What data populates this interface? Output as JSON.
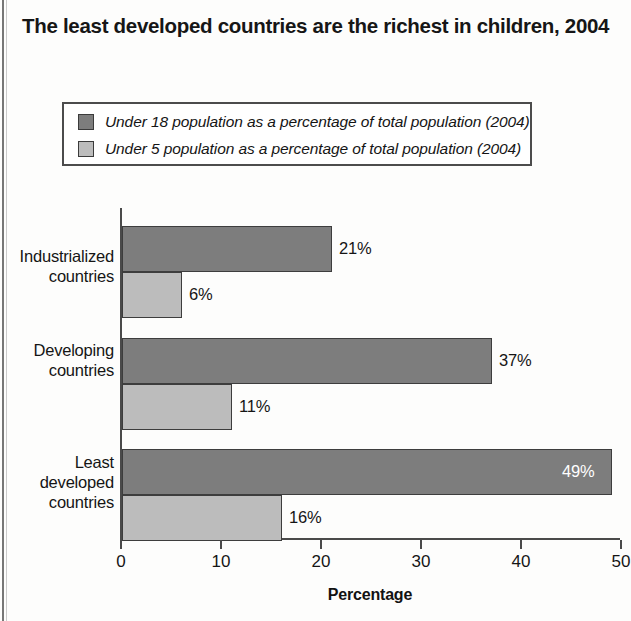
{
  "title": "The least developed countries are the richest in children, 2004",
  "legend": {
    "items": [
      {
        "label": "Under 18 population as a percentage of total population (2004)",
        "color": "#7d7d7d",
        "name": "under-18"
      },
      {
        "label": "Under 5 population as a percentage of total population (2004)",
        "color": "#bcbcbc",
        "name": "under-5"
      }
    ]
  },
  "chart_data": {
    "type": "bar",
    "orientation": "horizontal",
    "title": "The least developed countries are the richest in children, 2004",
    "xlabel": "Percentage",
    "ylabel": "",
    "xlim": [
      0,
      50
    ],
    "xticks": [
      0,
      10,
      20,
      30,
      40,
      50
    ],
    "xtick_labels": [
      "0",
      "10",
      "20",
      "30",
      "40",
      "50"
    ],
    "grid": false,
    "legend_position": "top",
    "categories": [
      "Industrialized countries",
      "Developing countries",
      "Least developed countries"
    ],
    "series": [
      {
        "name": "Under 18 population as a percentage of total population (2004)",
        "color": "#7d7d7d",
        "values": [
          21,
          37,
          49
        ],
        "labels": [
          "21%",
          "37%",
          "49%"
        ]
      },
      {
        "name": "Under 5 population as a percentage of total population (2004)",
        "color": "#bcbcbc",
        "values": [
          6,
          11,
          16
        ],
        "labels": [
          "6%",
          "11%",
          "16%"
        ]
      }
    ]
  },
  "axis": {
    "x_title": "Percentage",
    "ticks": [
      "0",
      "10",
      "20",
      "30",
      "40",
      "50"
    ]
  },
  "categories": [
    {
      "line1": "Industrialized",
      "line2": "countries",
      "line3": ""
    },
    {
      "line1": "Developing",
      "line2": "countries",
      "line3": ""
    },
    {
      "line1": "Least",
      "line2": "developed",
      "line3": "countries"
    }
  ],
  "bars": [
    {
      "value_label": "21%",
      "series": 0,
      "category": 0
    },
    {
      "value_label": "6%",
      "series": 1,
      "category": 0
    },
    {
      "value_label": "37%",
      "series": 0,
      "category": 1
    },
    {
      "value_label": "11%",
      "series": 1,
      "category": 1
    },
    {
      "value_label": "49%",
      "series": 0,
      "category": 2
    },
    {
      "value_label": "16%",
      "series": 1,
      "category": 2
    }
  ]
}
